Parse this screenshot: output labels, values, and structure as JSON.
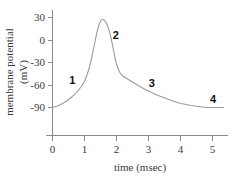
{
  "chart_data": {
    "type": "line",
    "title": "",
    "xlabel": "time (msec)",
    "ylabel_line1": "membrane potential",
    "ylabel_line2": "(mV)",
    "xlim": [
      0,
      5.4
    ],
    "ylim": [
      -100,
      38
    ],
    "grid": false,
    "legend": "none",
    "x_ticks": [
      "0",
      "1",
      "2",
      "3",
      "4",
      "5"
    ],
    "x_tick_values": [
      0,
      1,
      2,
      3,
      4,
      5
    ],
    "y_ticks": [
      "30",
      "0",
      "-30",
      "-60",
      "-90"
    ],
    "y_tick_values": [
      30,
      0,
      -30,
      -60,
      -90
    ],
    "series": [
      {
        "name": "action potential",
        "color": "#9c9c9c",
        "x": [
          0.0,
          0.15,
          0.3,
          0.45,
          0.6,
          0.75,
          0.9,
          1.0,
          1.1,
          1.2,
          1.3,
          1.4,
          1.5,
          1.6,
          1.7,
          1.8,
          1.9,
          2.0,
          2.1,
          2.2,
          2.35,
          2.5,
          2.7,
          2.9,
          3.1,
          3.3,
          3.55,
          3.8,
          4.05,
          4.3,
          4.6,
          4.9,
          5.2,
          5.35
        ],
        "y": [
          -90,
          -88,
          -85,
          -81,
          -76,
          -70,
          -62,
          -55,
          -44,
          -28,
          -8,
          12,
          25,
          27,
          21,
          8,
          -12,
          -32,
          -43,
          -48,
          -52,
          -56,
          -61,
          -66,
          -70,
          -74,
          -78,
          -82,
          -85,
          -87,
          -89,
          -90,
          -90,
          -90
        ]
      }
    ],
    "annotations": [
      {
        "label": "1",
        "x": 0.62,
        "y": -58,
        "note": "depolarization rising phase"
      },
      {
        "label": "2",
        "x": 1.98,
        "y": 2,
        "note": "repolarization falling phase"
      },
      {
        "label": "3",
        "x": 3.1,
        "y": -62,
        "note": "hyperpolarization recovery"
      },
      {
        "label": "4",
        "x": 5.02,
        "y": -84,
        "note": "resting potential restored"
      }
    ]
  }
}
